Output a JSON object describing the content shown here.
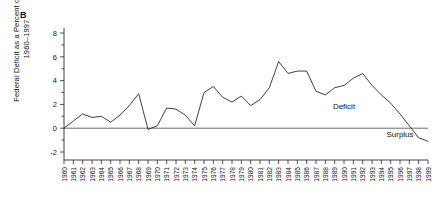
{
  "figure": {
    "panel_label": "B",
    "y_axis_title": "Federal Deficit as a Percent of GDP, 1960–1997"
  },
  "annotations": {
    "deficit": "Deficit",
    "surplus": "Surplus"
  },
  "colors": {
    "line": "#2a2a2a",
    "axis": "#2a2a2a",
    "background": "#ffffff",
    "text": "#111111"
  },
  "chart_data": {
    "type": "line",
    "title": "",
    "xlabel": "",
    "ylabel": "Federal Deficit as a Percent of GDP, 1960–1997",
    "ylim": [
      -2,
      8
    ],
    "yticks": [
      -2,
      0,
      2,
      4,
      6,
      8
    ],
    "ytick_labels": [
      "-2",
      "0",
      "2",
      "4",
      "6",
      "8"
    ],
    "grid": false,
    "legend": "none",
    "annotations": [
      {
        "text": "Deficit",
        "x": 1990,
        "y": 1.6
      },
      {
        "text": "Surplus",
        "x": 1996,
        "y": -0.75
      }
    ],
    "categories": [
      "1960",
      "1961",
      "1962",
      "1963",
      "1964",
      "1965",
      "1966",
      "1967",
      "1968",
      "1969",
      "1970",
      "1971",
      "1972",
      "1973",
      "1974",
      "1975",
      "1976",
      "1977",
      "1978",
      "1979",
      "1980",
      "1981",
      "1982",
      "1983",
      "1984",
      "1985",
      "1986",
      "1987",
      "1988",
      "1989",
      "1990",
      "1991",
      "1992",
      "1993",
      "1994",
      "1995",
      "1996",
      "1997",
      "1998",
      "1999"
    ],
    "x": [
      1960,
      1961,
      1962,
      1963,
      1964,
      1965,
      1966,
      1967,
      1968,
      1969,
      1970,
      1971,
      1972,
      1973,
      1974,
      1975,
      1976,
      1977,
      1978,
      1979,
      1980,
      1981,
      1982,
      1983,
      1984,
      1985,
      1986,
      1987,
      1988,
      1989,
      1990,
      1991,
      1992,
      1993,
      1994,
      1995,
      1996,
      1997,
      1998,
      1999
    ],
    "values": [
      0.0,
      0.6,
      1.2,
      0.9,
      1.0,
      0.5,
      1.1,
      1.9,
      2.9,
      -0.1,
      0.2,
      1.7,
      1.6,
      1.1,
      0.2,
      3.0,
      3.5,
      2.6,
      2.2,
      2.7,
      1.9,
      2.4,
      3.4,
      5.6,
      4.6,
      4.8,
      4.8,
      3.1,
      2.8,
      3.4,
      3.6,
      4.2,
      4.6,
      3.6,
      2.8,
      2.1,
      1.2,
      0.2,
      -0.8,
      -1.1
    ],
    "series": [
      {
        "name": "Federal deficit (% of GDP)",
        "values": [
          0.0,
          0.6,
          1.2,
          0.9,
          1.0,
          0.5,
          1.1,
          1.9,
          2.9,
          -0.1,
          0.2,
          1.7,
          1.6,
          1.1,
          0.2,
          3.0,
          3.5,
          2.6,
          2.2,
          2.7,
          1.9,
          2.4,
          3.4,
          5.6,
          4.6,
          4.8,
          4.8,
          3.1,
          2.8,
          3.4,
          3.6,
          4.2,
          4.6,
          3.6,
          2.8,
          2.1,
          1.2,
          0.2,
          -0.8,
          -1.1
        ]
      }
    ]
  }
}
